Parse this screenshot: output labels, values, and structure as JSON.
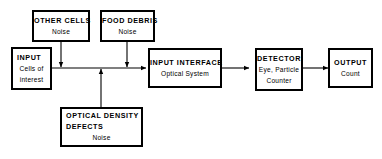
{
  "diagram": {
    "type": "block-flow-diagram",
    "background_color": "#ffffff",
    "line_color": "#000000",
    "boxes": {
      "other_cells": {
        "title": "OTHER CELLS",
        "subtitle": "Noise"
      },
      "food_debris": {
        "title": "FOOD DEBRIS",
        "subtitle": "Noise"
      },
      "input": {
        "title": "INPUT",
        "subtitle_line1": "Cells of",
        "subtitle_line2": "interest"
      },
      "optical_density_defects": {
        "title_line1": "OPTICAL DENSITY",
        "title_line2": "DEFECTS",
        "subtitle": "Noise"
      },
      "input_interface": {
        "title": "INPUT INTERFACE",
        "subtitle": "Optical System"
      },
      "detector": {
        "title": "DETECTOR",
        "subtitle_line1": "Eye, Particle",
        "subtitle_line2": "Counter"
      },
      "output": {
        "title": "OUTPUT",
        "subtitle": "Count"
      }
    }
  }
}
